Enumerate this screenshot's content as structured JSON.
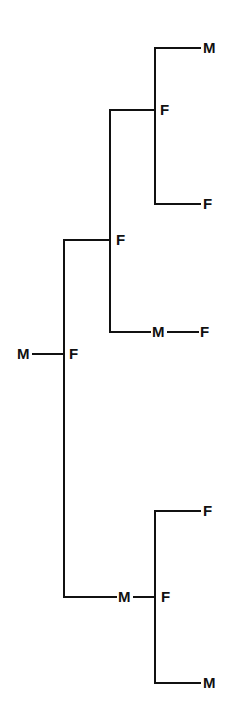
{
  "figure": {
    "type": "pedigree-tree-diagram",
    "width": 241,
    "height": 726,
    "background_color": "#ffffff",
    "line_color": "#111111",
    "line_width": 2,
    "label_color": "#111111"
  },
  "nodes": [
    {
      "id": "n1",
      "label": "M",
      "x": 203,
      "y": 48,
      "anchor": "left",
      "name": "node-m-top-right"
    },
    {
      "id": "n2",
      "label": "F",
      "x": 160,
      "y": 110,
      "anchor": "left",
      "name": "node-f-upper-branch"
    },
    {
      "id": "n3",
      "label": "F",
      "x": 203,
      "y": 204,
      "anchor": "left",
      "name": "node-f-upper-lower-leaf"
    },
    {
      "id": "n4",
      "label": "F",
      "x": 116,
      "y": 240,
      "anchor": "left",
      "name": "node-f-upper-mid-branch"
    },
    {
      "id": "n5",
      "label": "M",
      "x": 152,
      "y": 332,
      "anchor": "left",
      "name": "node-m-mid-pair"
    },
    {
      "id": "n6",
      "label": "F",
      "x": 200,
      "y": 332,
      "anchor": "left",
      "name": "node-f-mid-pair"
    },
    {
      "id": "n7",
      "label": "M",
      "x": 17,
      "y": 354,
      "anchor": "left",
      "name": "node-m-root-pair"
    },
    {
      "id": "n8",
      "label": "F",
      "x": 69,
      "y": 354,
      "anchor": "left",
      "name": "node-f-root"
    },
    {
      "id": "n9",
      "label": "F",
      "x": 203,
      "y": 511,
      "anchor": "left",
      "name": "node-f-lower-upper-leaf"
    },
    {
      "id": "n10",
      "label": "M",
      "x": 118,
      "y": 597,
      "anchor": "left",
      "name": "node-m-lower-pair"
    },
    {
      "id": "n11",
      "label": "F",
      "x": 161,
      "y": 597,
      "anchor": "left",
      "name": "node-f-lower-branch"
    },
    {
      "id": "n12",
      "label": "M",
      "x": 203,
      "y": 683,
      "anchor": "left",
      "name": "node-m-bottom-leaf"
    }
  ],
  "edges": [
    {
      "name": "edge-top-m-horizontal",
      "x1": 155,
      "y1": 48,
      "x2": 200,
      "y2": 48
    },
    {
      "name": "edge-upper-right-vertical",
      "x1": 155,
      "y1": 48,
      "x2": 155,
      "y2": 204
    },
    {
      "name": "edge-upper-f-horizontal",
      "x1": 110,
      "y1": 110,
      "x2": 155,
      "y2": 110
    },
    {
      "name": "edge-upper-lower-leaf-horiz",
      "x1": 155,
      "y1": 204,
      "x2": 200,
      "y2": 204
    },
    {
      "name": "edge-upper-mid-vertical",
      "x1": 110,
      "y1": 110,
      "x2": 110,
      "y2": 332
    },
    {
      "name": "edge-mid-f-horizontal",
      "x1": 64,
      "y1": 240,
      "x2": 110,
      "y2": 240
    },
    {
      "name": "edge-mid-pair-horizontal",
      "x1": 110,
      "y1": 332,
      "x2": 150,
      "y2": 332
    },
    {
      "name": "edge-mid-pair-link",
      "x1": 168,
      "y1": 332,
      "x2": 198,
      "y2": 332
    },
    {
      "name": "edge-trunk-vertical",
      "x1": 64,
      "y1": 240,
      "x2": 64,
      "y2": 597
    },
    {
      "name": "edge-root-pair-horizontal",
      "x1": 33,
      "y1": 354,
      "x2": 64,
      "y2": 354
    },
    {
      "name": "edge-lower-trunk-horizontal",
      "x1": 64,
      "y1": 597,
      "x2": 116,
      "y2": 597
    },
    {
      "name": "edge-lower-pair-link",
      "x1": 134,
      "y1": 597,
      "x2": 155,
      "y2": 597
    },
    {
      "name": "edge-lower-right-vertical",
      "x1": 155,
      "y1": 511,
      "x2": 155,
      "y2": 683
    },
    {
      "name": "edge-lower-upper-leaf-horiz",
      "x1": 155,
      "y1": 511,
      "x2": 200,
      "y2": 511
    },
    {
      "name": "edge-lower-bottom-leaf-horiz",
      "x1": 155,
      "y1": 683,
      "x2": 200,
      "y2": 683
    }
  ]
}
